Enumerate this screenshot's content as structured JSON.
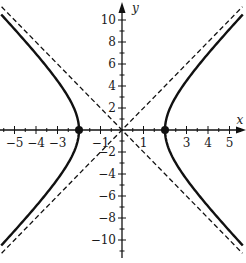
{
  "chart_data": {
    "type": "line",
    "title": "",
    "xlabel": "x",
    "ylabel": "y",
    "xlim": [
      -5.6,
      5.6
    ],
    "ylim": [
      -11,
      11
    ],
    "grid": false,
    "x_ticks": [
      -5,
      -4,
      -3,
      -1,
      1,
      3,
      4,
      5
    ],
    "x_tick_labels": [
      "−5",
      "−4",
      "−3",
      "−1",
      "1",
      "3",
      "4",
      "5"
    ],
    "y_ticks": [
      -10,
      -8,
      -6,
      -4,
      -2,
      2,
      4,
      6,
      8,
      10
    ],
    "y_tick_labels": [
      "−10",
      "−8",
      "−6",
      "−4",
      "−2",
      "2",
      "4",
      "6",
      "8",
      "10"
    ],
    "equation": "x^2/4 - y^2/16 = 1",
    "series": [
      {
        "name": "hyperbola",
        "style": "solid",
        "a": 2,
        "b": 4,
        "branches": [
          "left",
          "right"
        ]
      },
      {
        "name": "asymptote y = 2x",
        "style": "dashed",
        "slope": 2
      },
      {
        "name": "asymptote y = -2x",
        "style": "dashed",
        "slope": -2
      }
    ],
    "points": [
      {
        "label": "vertex-left",
        "x": -2,
        "y": 0
      },
      {
        "label": "vertex-right",
        "x": 2,
        "y": 0
      }
    ]
  },
  "colors": {
    "stroke": "#111111",
    "background": "#ffffff"
  }
}
